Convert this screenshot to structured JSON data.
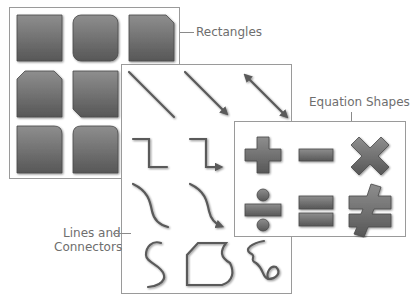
{
  "labels": {
    "rectangles": "Rectangles",
    "equation_shapes": "Equation Shapes",
    "lines_line1": "Lines and",
    "lines_line2": "Connectors"
  },
  "panels": {
    "rectangles": {
      "items": [
        "rectangle",
        "rounded-rectangle",
        "snip-single-corner-rectangle",
        "snip-same-side-corner-rectangle",
        "snip-diagonal-corner-rectangle",
        "round-single-corner-rectangle"
      ],
      "extra_items": [
        "round-same-side-corner-rectangle"
      ]
    },
    "lines": {
      "items": [
        "line",
        "line-arrow",
        "line-double-arrow",
        "elbow-connector",
        "elbow-arrow-connector",
        "curved-connector",
        "curved-arrow-connector",
        "curve",
        "freeform",
        "scribble"
      ]
    },
    "equations": {
      "items": [
        "plus",
        "minus",
        "multiply",
        "division",
        "equal",
        "not-equal"
      ]
    }
  },
  "colors": {
    "shape_fill_top": "#8c8c8c",
    "shape_fill_bottom": "#5a5a5a",
    "shape_stroke": "#4a4a4a",
    "panel_border": "#9a9a9a",
    "label_text": "#6e6e6e"
  }
}
